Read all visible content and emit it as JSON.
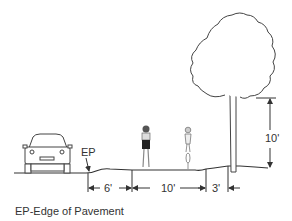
{
  "diagram": {
    "type": "cross-section",
    "labels": {
      "ep": "EP",
      "caption": "EP-Edge of Pavement"
    },
    "dimensions": {
      "shoulder": "6'",
      "path_width": "10'",
      "tree_offset": "3'",
      "vertical_clearance": "10'"
    },
    "elements": [
      "car",
      "pedestrian",
      "cyclist",
      "tree"
    ],
    "colors": {
      "line": "#333333",
      "background": "#ffffff"
    }
  }
}
